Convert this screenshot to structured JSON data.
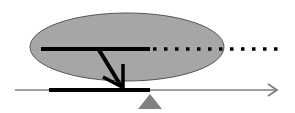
{
  "diagram": {
    "colors": {
      "background": "#ffffff",
      "ellipse_fill": "#a6a6a6",
      "ellipse_stroke": "#555555",
      "bar": "#000000",
      "axis": "#7f7f7f",
      "fulcrum": "#808080"
    },
    "elements": [
      "ellipse",
      "upper-bar",
      "dotted-extension",
      "down-arrow",
      "axis-arrow",
      "axis-segment",
      "fulcrum-triangle"
    ]
  }
}
